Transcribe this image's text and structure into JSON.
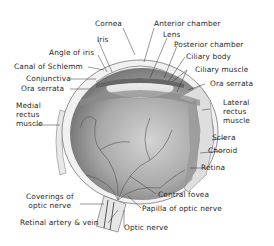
{
  "diagram": {
    "labels": {
      "cornea": "Cornea",
      "anterior_chamber": "Anterior chamber",
      "iris": "Iris",
      "lens": "Lens",
      "angle_of_iris": "Angle of iris",
      "posterior_chamber": "Posterior chamber",
      "canal_of_schlemm": "Canal of Schlemm",
      "ciliary_body": "Ciliary body",
      "conjunctiva": "Conjunctiva",
      "ciliary_muscle": "Ciliary muscle",
      "ora_serrata_left": "Ora serrata",
      "ora_serrata_right": "Ora serrata",
      "medial_rectus": "Medial\nrectus\nmuscle",
      "lateral_rectus": "Lateral\nrectus\nmuscle",
      "sclera": "Sclera",
      "choroid": "Choroid",
      "retina": "Retina",
      "coverings_optic_nerve": "Coverings of\noptic nerve",
      "central_fovea": "Central fovea",
      "papilla_optic_nerve": "Papilla of optic nerve",
      "retinal_artery_vein": "Retinal artery & vein",
      "optic_nerve": "Optic nerve"
    },
    "colors": {
      "background": "#ffffff",
      "eyeball": "#b9b9b9",
      "eyeball_dark": "#7d7d7d",
      "vessel": "#555555",
      "leader_line": "#333333",
      "text": "#2a2a2a"
    }
  }
}
